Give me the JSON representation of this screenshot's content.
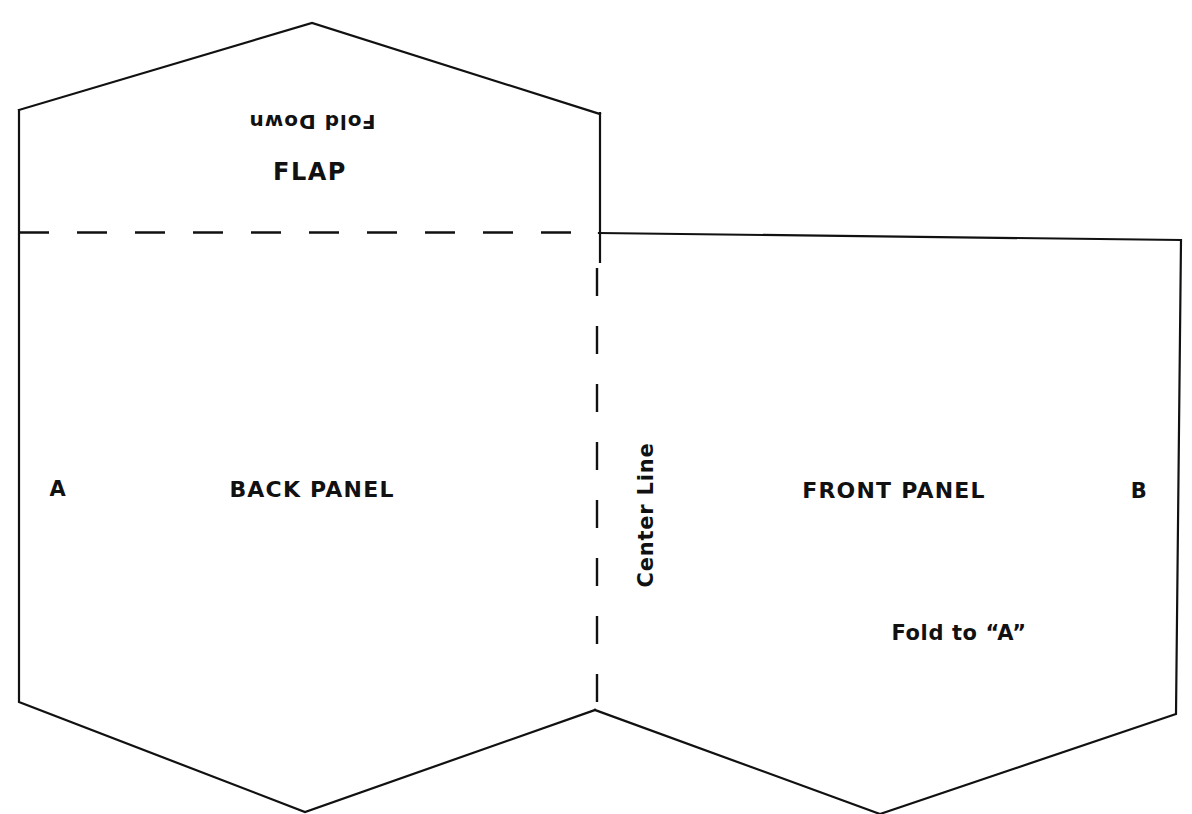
{
  "document": {
    "title": "Envelope Fold Template",
    "type": "fold-pattern-diagram",
    "background_color": "#ffffff",
    "line_color": "#111111",
    "text_color": "#111111"
  },
  "labels": {
    "fold_down": "Fold Down",
    "flap": "FLAP",
    "marker_a": "A",
    "back_panel": "BACK PANEL",
    "center_line": "Center Line",
    "front_panel": "FRONT PANEL",
    "marker_b": "B",
    "fold_to_a": "Fold to “A”"
  },
  "geometry": {
    "canvas": {
      "width": 1192,
      "height": 814
    },
    "flap_outline": "19,110 312,23 600,114",
    "left_panel_outline": "19,110 19,702 305,812 595,710 597,268",
    "right_panel_outline": "599,233 1181,240 1176,714 880,814 595,710",
    "flap_right_edge": {
      "x": 600,
      "y1": 114,
      "y2": 262
    },
    "horizontal_fold_line": {
      "x1": 19,
      "y1": 232,
      "x2": 599,
      "y2": 233
    },
    "vertical_center_line": {
      "x": 597,
      "y1": 268,
      "y2": 710
    },
    "dash_pattern_horizontal": "30 28",
    "dash_pattern_vertical": "28 30",
    "stroke_width": 2.2
  }
}
